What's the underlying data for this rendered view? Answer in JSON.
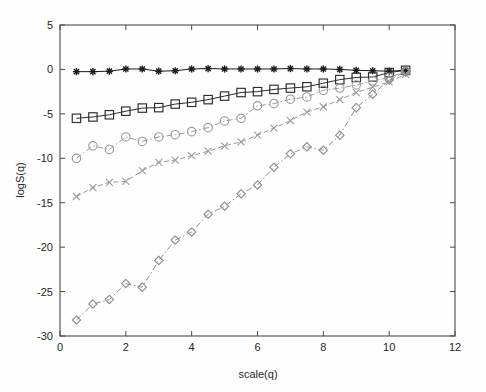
{
  "figure": {
    "background": "#fefefe",
    "axes_color": "#4a4a4a"
  },
  "chart_data": {
    "type": "line",
    "title": "",
    "subtitle": "",
    "xlabel": "scale(q)",
    "ylabel": "logS(q)",
    "xlim": [
      0,
      12
    ],
    "ylim": [
      -30,
      5
    ],
    "xticks": [
      0,
      2,
      4,
      6,
      8,
      10,
      12
    ],
    "yticks": [
      5,
      0,
      -5,
      -10,
      -15,
      -20,
      -25,
      -30
    ],
    "xtick_labels": [
      "0",
      "2",
      "4",
      "6",
      "8",
      "10",
      "12"
    ],
    "ytick_labels": [
      "5",
      "0",
      "-5",
      "-10",
      "-15",
      "-20",
      "-25",
      "-30"
    ],
    "grid": false,
    "legend": null,
    "legend_position": "none",
    "x": [
      0.5,
      1.0,
      1.5,
      2.0,
      2.5,
      3.0,
      3.5,
      4.0,
      4.5,
      5.0,
      5.5,
      6.0,
      6.5,
      7.0,
      7.5,
      8.0,
      8.5,
      9.0,
      9.5,
      10.0,
      10.5
    ],
    "series": [
      {
        "name": "series-star",
        "marker": "star",
        "linestyle": "solid",
        "color": "#1a1a1a",
        "values": [
          -0.25,
          -0.25,
          -0.2,
          0.05,
          0.05,
          -0.2,
          -0.15,
          0.05,
          0.1,
          0.05,
          0.05,
          0.05,
          0.05,
          0.1,
          0.05,
          0.05,
          0.0,
          -0.1,
          -0.15,
          -0.2,
          -0.1
        ]
      },
      {
        "name": "series-square",
        "marker": "square",
        "linestyle": "solid",
        "color": "#2b2b2b",
        "values": [
          -5.5,
          -5.35,
          -5.1,
          -4.7,
          -4.35,
          -4.3,
          -3.9,
          -3.7,
          -3.4,
          -3.0,
          -2.6,
          -2.5,
          -2.25,
          -2.1,
          -1.95,
          -1.55,
          -1.15,
          -0.9,
          -0.85,
          -0.35,
          -0.1
        ]
      },
      {
        "name": "series-circle",
        "marker": "circle",
        "linestyle": "dashdot",
        "color": "#9a9a9a",
        "values": [
          -10.0,
          -8.6,
          -9.0,
          -7.6,
          -8.1,
          -7.6,
          -7.35,
          -7.0,
          -6.55,
          -5.8,
          -5.5,
          -4.1,
          -3.85,
          -3.35,
          -3.1,
          -2.35,
          -2.1,
          -1.75,
          -1.3,
          -0.9,
          -0.25
        ]
      },
      {
        "name": "series-x",
        "marker": "x",
        "linestyle": "dashed",
        "color": "#9a9a9a",
        "values": [
          -14.3,
          -13.3,
          -12.7,
          -12.6,
          -11.4,
          -10.45,
          -10.2,
          -9.7,
          -9.2,
          -8.6,
          -8.15,
          -7.4,
          -6.6,
          -5.75,
          -4.8,
          -4.2,
          -3.4,
          -2.6,
          -2.0,
          -1.4,
          -0.55
        ]
      },
      {
        "name": "series-diamond",
        "marker": "diamond",
        "linestyle": "dashdot",
        "color": "#8f8f8f",
        "values": [
          -28.2,
          -26.4,
          -25.9,
          -24.1,
          -24.5,
          -21.5,
          -19.2,
          -18.3,
          -16.3,
          -15.4,
          -14.0,
          -13.0,
          -11.0,
          -9.5,
          -8.7,
          -9.1,
          -7.4,
          -4.3,
          -2.8,
          -1.2,
          -0.25
        ]
      }
    ]
  }
}
